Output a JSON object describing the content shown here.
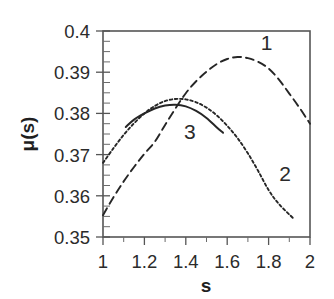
{
  "chart_data": {
    "type": "line",
    "title": "",
    "xlabel": "s",
    "ylabel": "μ(s)",
    "xlim": [
      1,
      2
    ],
    "ylim": [
      0.35,
      0.4
    ],
    "grid": false,
    "legend_position": "inline-curve-labels",
    "x_ticks": [
      "1",
      "1.2",
      "1.4",
      "1.6",
      "1.8",
      "2"
    ],
    "x_tick_values": [
      1,
      1.2,
      1.4,
      1.6,
      1.8,
      2
    ],
    "y_ticks": [
      "0.35",
      "0.36",
      "0.37",
      "0.38",
      "0.39",
      "0.4"
    ],
    "y_tick_values": [
      0.35,
      0.36,
      0.37,
      0.38,
      0.39,
      0.4
    ],
    "series": [
      {
        "name": "1",
        "label": "1",
        "style": "dashed",
        "color": "#262626",
        "x": [
          1.0,
          1.05,
          1.1,
          1.15,
          1.2,
          1.25,
          1.3,
          1.35,
          1.4,
          1.45,
          1.5,
          1.55,
          1.6,
          1.65,
          1.7,
          1.75,
          1.8,
          1.85,
          1.9,
          1.95,
          2.0
        ],
        "values": [
          0.3553,
          0.3596,
          0.3635,
          0.367,
          0.3702,
          0.3731,
          0.3772,
          0.3812,
          0.3849,
          0.3878,
          0.3901,
          0.392,
          0.3932,
          0.3937,
          0.3934,
          0.3925,
          0.3909,
          0.3882,
          0.3848,
          0.3813,
          0.3775
        ]
      },
      {
        "name": "2",
        "label": "2",
        "style": "dotted",
        "color": "#262626",
        "x": [
          1.0,
          1.05,
          1.1,
          1.15,
          1.2,
          1.25,
          1.3,
          1.35,
          1.4,
          1.45,
          1.5,
          1.55,
          1.6,
          1.65,
          1.7,
          1.75,
          1.8,
          1.85,
          1.92
        ],
        "values": [
          0.368,
          0.3715,
          0.3748,
          0.3776,
          0.38,
          0.3818,
          0.383,
          0.3835,
          0.3834,
          0.3827,
          0.3814,
          0.3795,
          0.377,
          0.374,
          0.3703,
          0.366,
          0.3614,
          0.358,
          0.3545
        ]
      },
      {
        "name": "3",
        "label": "3",
        "style": "solid",
        "color": "#262626",
        "x": [
          1.11,
          1.15,
          1.2,
          1.25,
          1.3,
          1.35,
          1.4,
          1.45,
          1.5,
          1.55,
          1.58
        ],
        "values": [
          0.3767,
          0.3785,
          0.38,
          0.3812,
          0.3819,
          0.3821,
          0.3817,
          0.3806,
          0.3789,
          0.3766,
          0.3753
        ]
      }
    ],
    "annotations": [
      {
        "text": "1",
        "x": 1.79,
        "y": 0.3955
      },
      {
        "text": "2",
        "x": 1.88,
        "y": 0.3636
      },
      {
        "text": "3",
        "x": 1.42,
        "y": 0.3739
      }
    ]
  },
  "axes": {
    "y_axis_title": "μ(s)",
    "x_axis_title": "s"
  }
}
